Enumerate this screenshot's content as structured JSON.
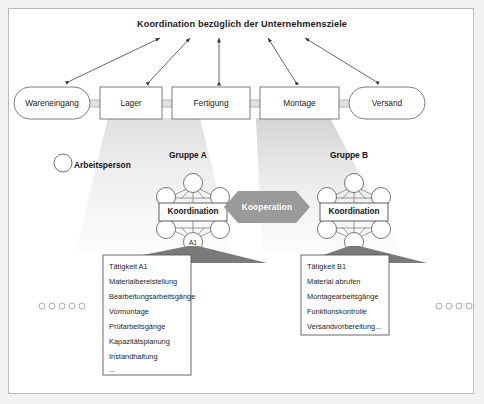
{
  "figure": {
    "title": "Koordination bezüglich der Unternehmensziele",
    "type": "organizational-diagram",
    "background_color": "#ffffff",
    "frame_border_color": "#b9b9b9",
    "page_background": "#f2f2f0"
  },
  "process_chain": {
    "steps": [
      {
        "label": "Wareneingang",
        "shape": "rounded-capsule"
      },
      {
        "label": "Lager",
        "shape": "rectangle"
      },
      {
        "label": "Fertigung",
        "shape": "rectangle"
      },
      {
        "label": "Montage",
        "shape": "rectangle"
      },
      {
        "label": "Versand",
        "shape": "rounded-capsule"
      }
    ],
    "connector_count": 4,
    "arrow_count": 5,
    "arrow_style": "double-headed"
  },
  "legend": {
    "symbol": "circle",
    "label": "Arbeitsperson"
  },
  "groups": [
    {
      "id": "A",
      "title": "Gruppe A",
      "center_label": "Koordination",
      "highlighted_node": "A1",
      "node_count": 6
    },
    {
      "id": "B",
      "title": "Gruppe B",
      "center_label": "Koordination",
      "highlighted_node": "",
      "node_count": 6
    }
  ],
  "cooperation": {
    "label": "Kooperation",
    "shape": "hexagon",
    "fill": "#9a9a9a"
  },
  "task_boxes": [
    {
      "id": "A1",
      "items": [
        "Tätigkeit A1",
        "Materialbereistellung",
        "Bearbeitungsarbeitsgänge",
        "Vormontage",
        "Prüfarbeitsgänge",
        "Kapazitätsplanung",
        "Instandhaltung",
        "..."
      ]
    },
    {
      "id": "B1",
      "items": [
        "Tätigkeit B1",
        "Material abrufen",
        "Montagearbeitsgänge",
        "Funktionskontrolle",
        "Versandvorbereitung..."
      ]
    }
  ],
  "side_markers": {
    "left_circle_count": 5,
    "right_circle_count": 4
  }
}
